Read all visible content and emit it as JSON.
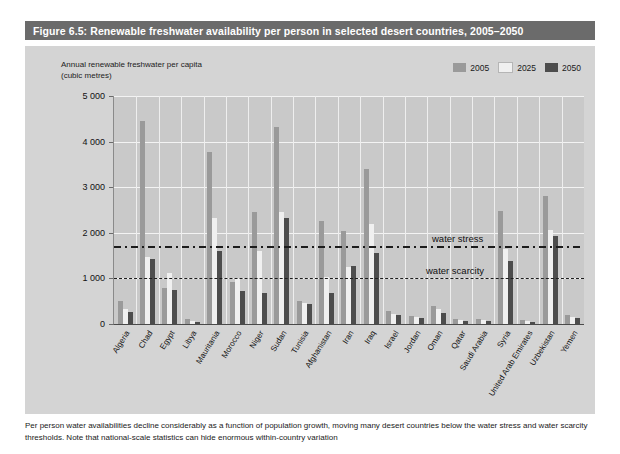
{
  "figure": {
    "title": "Figure 6.5: Renewable freshwater availability per person in selected desert countries, 2005–2050",
    "caption": "Per person water availabilities decline considerably as a function of population growth, moving many desert countries below the water stress and water scarcity thresholds. Note that national-scale statistics can hide enormous within-country variation"
  },
  "colors": {
    "title_bar": "#6b6b6b",
    "panel": "#d4d4d4",
    "plot": "#c9c9c9",
    "series_2005": "#9a9a9a",
    "series_2025": "#f0f0f0",
    "series_2050": "#4d4d4d",
    "threshold": "#1c1c1c"
  },
  "chart_data": {
    "type": "bar",
    "title": "Renewable freshwater availability per person in selected desert countries, 2005–2050",
    "xlabel": "",
    "ylabel": "Annual renewable freshwater per capita\n(cubic metres)",
    "ylim": [
      0,
      5000
    ],
    "yticks": [
      0,
      1000,
      2000,
      3000,
      4000,
      5000
    ],
    "ytick_labels": [
      "0",
      "1 000",
      "2 000",
      "3 000",
      "4 000",
      "5 000"
    ],
    "grid": true,
    "legend_position": "top-right",
    "categories": [
      "Algeria",
      "Chad",
      "Egypt",
      "Libya",
      "Mauritania",
      "Morocco",
      "Niger",
      "Sudan",
      "Tunisia",
      "Afghanistan",
      "Iran",
      "Iraq",
      "Israel",
      "Jordan",
      "Oman",
      "Qatar",
      "Saudi Arabia",
      "Syria",
      "United Arab Emirates",
      "Uzbekistan",
      "Yemen"
    ],
    "series": [
      {
        "name": "2005",
        "color": "#9a9a9a",
        "values": [
          510,
          4450,
          780,
          105,
          3780,
          920,
          2450,
          4320,
          500,
          2260,
          2030,
          3400,
          280,
          170,
          390,
          110,
          100,
          2480,
          90,
          2800,
          190
        ]
      },
      {
        "name": "2025",
        "color": "#f0f0f0",
        "values": [
          330,
          1470,
          1110,
          70,
          2320,
          1020,
          1600,
          2450,
          470,
          1040,
          1250,
          2200,
          230,
          150,
          320,
          90,
          80,
          1650,
          60,
          2060,
          150
        ]
      },
      {
        "name": "2050",
        "color": "#4d4d4d",
        "values": [
          260,
          1420,
          750,
          45,
          1600,
          720,
          690,
          2330,
          440,
          690,
          1270,
          1550,
          200,
          130,
          240,
          70,
          60,
          1380,
          50,
          1920,
          130
        ]
      }
    ],
    "thresholds": [
      {
        "label": "water stress",
        "value": 1700,
        "style": "dash-dot"
      },
      {
        "label": "water scarcity",
        "value": 1000,
        "style": "dashed"
      }
    ]
  }
}
